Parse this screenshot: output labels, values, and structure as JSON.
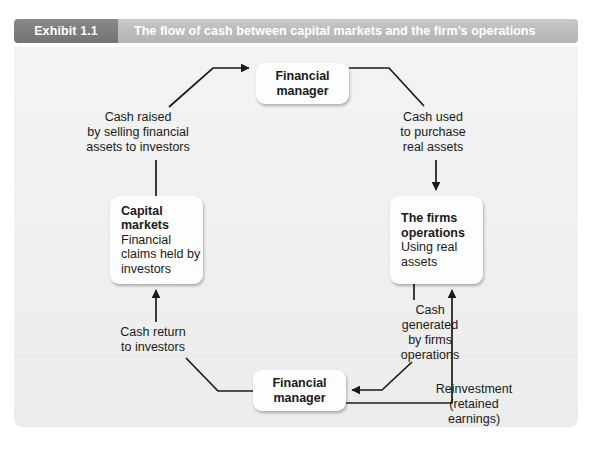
{
  "header": {
    "tag": "Exhibit 1.1",
    "title": "The flow of cash between capital markets and the firm’s operations"
  },
  "nodes": {
    "financial_manager_top": {
      "title": "Financial\nmanager"
    },
    "capital_markets": {
      "title": "Capital\nmarkets",
      "subtitle": "Financial\nclaims held\nby investors"
    },
    "firms_operations": {
      "title": "The firms\noperations",
      "subtitle": "Using\nreal\nassets"
    },
    "financial_manager_bottom": {
      "title": "Financial\nmanager"
    }
  },
  "labels": {
    "cash_raised": "Cash raised\nby selling financial\nassets to investors",
    "cash_used": "Cash used\nto purchase\nreal assets",
    "cash_return": "Cash return\nto investors",
    "cash_generated": "Cash\ngenerated\nby firms\noperations",
    "reinvestment": "Reinvestment\n(retained\nearnings)"
  },
  "colors": {
    "tag_background": "#7d7d7d",
    "header_background": "#bdbdbd",
    "header_text": "#ffffff",
    "canvas_background": "#f1f1f1",
    "node_background": "#fdfdfd",
    "line": "#1a1a1a",
    "text": "#1a1a1a"
  },
  "diagram": {
    "type": "cycle-flow-diagram",
    "flow_order": [
      "Capital markets",
      "Cash raised by selling financial assets to investors",
      "Financial manager",
      "Cash used to purchase real assets",
      "The firms operations",
      "Cash generated by firms operations",
      "Financial manager",
      "Cash return to investors",
      "Capital markets"
    ],
    "branch": "Reinvestment (retained earnings) returns from Financial manager back to The firms operations"
  }
}
